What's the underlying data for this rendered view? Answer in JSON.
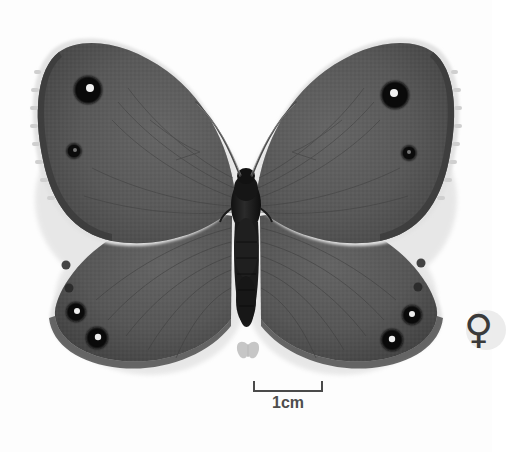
{
  "plate": {
    "background_color": "#fdfdfd",
    "subject": "butterfly specimen dorsal view",
    "orientation": "wings spread, head up"
  },
  "scale": {
    "label": "1cm",
    "bar_color": "#4a4a4a",
    "bar_length_px": 70
  },
  "watermark": {
    "icon_name": "butterfly-icon",
    "color": "#9a9a9a"
  },
  "sex_marker": {
    "symbol": "♀",
    "meaning": "female",
    "disc_color": "#ececec",
    "glyph_color": "#3a3a3a"
  },
  "specimen": {
    "body": {
      "thorax_color": "#1d1d1d",
      "abdomen_color": "#222222"
    },
    "wing": {
      "base_color": "#5a5a5a",
      "dark_color": "#474747",
      "light_color": "#6d6d6d",
      "margin_color": "#3c3c3c",
      "fringe_color": "#d8d8d8"
    },
    "eyespots": {
      "ring_color": "#121212",
      "pupil_color": "#f2f2f2",
      "forewing_left": [
        {
          "cx": 88,
          "cy": 90,
          "r": 13,
          "pupil": 4
        },
        {
          "cx": 74,
          "cy": 151,
          "r": 7,
          "pupil": 2
        }
      ],
      "forewing_right": [
        {
          "cx": 395,
          "cy": 95,
          "r": 12,
          "pupil": 4
        },
        {
          "cx": 409,
          "cy": 153,
          "r": 7,
          "pupil": 2
        }
      ],
      "hindwing_left": [
        {
          "cx": 76,
          "cy": 312,
          "r": 9,
          "pupil": 3
        },
        {
          "cx": 96,
          "cy": 338,
          "r": 10,
          "pupil": 3
        },
        {
          "cx": 66,
          "cy": 265,
          "r": 4,
          "pupil": 1
        },
        {
          "cx": 69,
          "cy": 288,
          "r": 4,
          "pupil": 1
        }
      ],
      "hindwing_right": [
        {
          "cx": 412,
          "cy": 315,
          "r": 9,
          "pupil": 3
        },
        {
          "cx": 392,
          "cy": 340,
          "r": 10,
          "pupil": 3
        },
        {
          "cx": 421,
          "cy": 263,
          "r": 4,
          "pupil": 1
        },
        {
          "cx": 418,
          "cy": 287,
          "r": 4,
          "pupil": 1
        }
      ]
    },
    "antennae": {
      "color": "#4a4a4a",
      "count": 2
    }
  }
}
